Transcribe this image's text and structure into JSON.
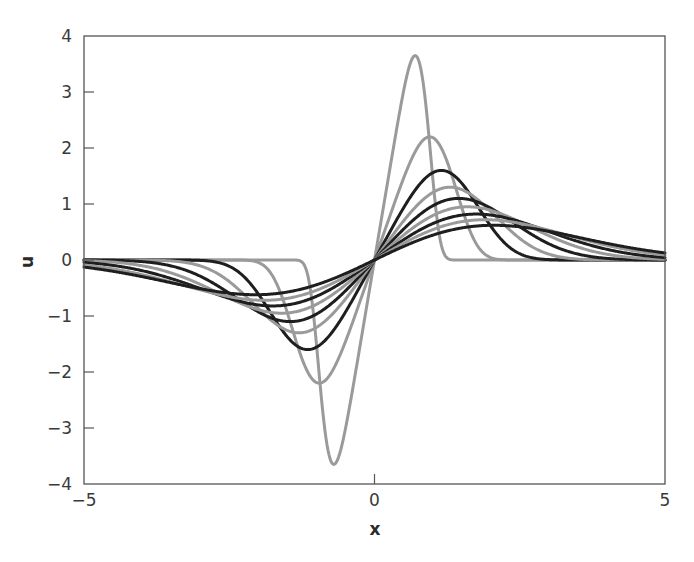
{
  "chart_data": {
    "type": "line",
    "title": "",
    "xlabel": "x",
    "ylabel": "u",
    "xlim": [
      -5,
      5
    ],
    "ylim": [
      -4,
      4
    ],
    "xticks": [
      -5,
      0,
      5
    ],
    "yticks": [
      -4,
      -3,
      -2,
      -1,
      0,
      1,
      2,
      3,
      4
    ],
    "grid": false,
    "legend": null,
    "series": [
      {
        "name": "curve-1",
        "color": "#9a9a9a",
        "peak_x": 0.7,
        "peak_u": 3.65,
        "shape": 6.0
      },
      {
        "name": "curve-2",
        "color": "#9a9a9a",
        "peak_x": 0.95,
        "peak_u": 2.2,
        "shape": 4.0
      },
      {
        "name": "curve-3",
        "color": "#1e1e1e",
        "peak_x": 1.15,
        "peak_u": 1.6,
        "shape": 3.2
      },
      {
        "name": "curve-4",
        "color": "#9a9a9a",
        "peak_x": 1.3,
        "peak_u": 1.3,
        "shape": 2.8
      },
      {
        "name": "curve-5",
        "color": "#1e1e1e",
        "peak_x": 1.45,
        "peak_u": 1.1,
        "shape": 2.5
      },
      {
        "name": "curve-6",
        "color": "#9a9a9a",
        "peak_x": 1.6,
        "peak_u": 0.95,
        "shape": 2.3
      },
      {
        "name": "curve-7",
        "color": "#1e1e1e",
        "peak_x": 1.75,
        "peak_u": 0.82,
        "shape": 2.15
      },
      {
        "name": "curve-8",
        "color": "#9a9a9a",
        "peak_x": 1.9,
        "peak_u": 0.72,
        "shape": 2.05
      },
      {
        "name": "curve-9",
        "color": "#1e1e1e",
        "peak_x": 2.05,
        "peak_u": 0.62,
        "shape": 2.0
      }
    ]
  },
  "plot_area": {
    "left": 84,
    "top": 36,
    "right": 665,
    "bottom": 484
  }
}
